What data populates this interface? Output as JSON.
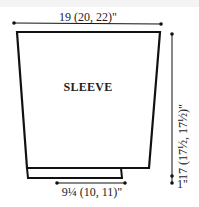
{
  "diagram": {
    "title": "SLEEVE",
    "dimensions": {
      "top_width": "19 (20, 22)\"",
      "bottom_width": "9¼ (10, 11)\"",
      "length": "17 (17½, 17½)\"",
      "cuff": "1\""
    },
    "colors": {
      "line": "#111111",
      "text": "#222222",
      "background": "#ffffff"
    }
  }
}
